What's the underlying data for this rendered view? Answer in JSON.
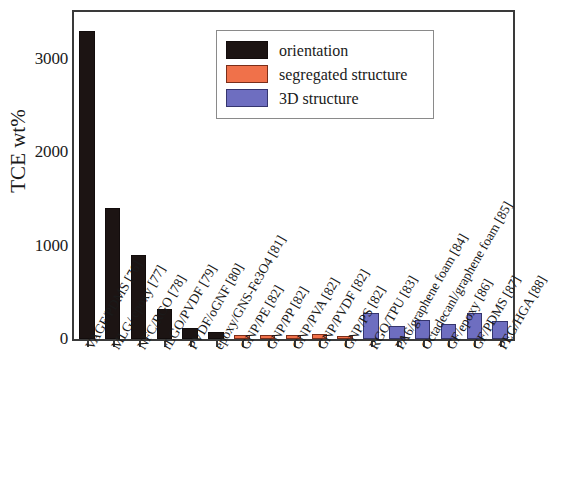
{
  "chart_data": {
    "type": "bar",
    "title": "",
    "xlabel": "",
    "ylabel": "TCE wt%",
    "ylim": [
      0,
      3500
    ],
    "yticks": [
      0,
      1000,
      2000,
      3000
    ],
    "yticks_minor": [
      500,
      1500,
      2500,
      3500
    ],
    "ytick_labels": [
      "0",
      "1000",
      "2000",
      "3000"
    ],
    "grid": false,
    "legend_position": "upper center",
    "legend": [
      {
        "key": "orientation",
        "label": "orientation",
        "color": "#1c1413"
      },
      {
        "key": "segregated",
        "label": "segregated structure",
        "color": "#f0714a"
      },
      {
        "key": "3d",
        "label": "3D structure",
        "color": "#6e6ec0"
      }
    ],
    "categories": [
      "VAGF/PDMS [76]",
      "MLG/ epoxy [77]",
      "NFC/RGO [78]",
      "rLGO/PVDF [79]",
      "PVDF/oGNF [80]",
      "epoxy/GNS-Fe3O4 [81]",
      "GNP/PE [82]",
      "GNP/PP [82]",
      "GNP/PVA [82]",
      "GNP/PVDF [82]",
      "GNP/PS [82]",
      "RGO/TPU [83]",
      "PA6/graphene foam [84]",
      "Octadecanl/graphene foam [85]",
      "GF/epoxy [86]",
      "GF/PDMS [87]",
      "PEG/HGA [88]"
    ],
    "values": [
      3300,
      1400,
      900,
      320,
      120,
      70,
      40,
      45,
      45,
      50,
      35,
      280,
      140,
      200,
      160,
      280,
      190
    ],
    "group_of_bar": [
      "orientation",
      "orientation",
      "orientation",
      "orientation",
      "orientation",
      "orientation",
      "segregated",
      "segregated",
      "segregated",
      "segregated",
      "segregated",
      "3d",
      "3d",
      "3d",
      "3d",
      "3d",
      "3d"
    ]
  }
}
